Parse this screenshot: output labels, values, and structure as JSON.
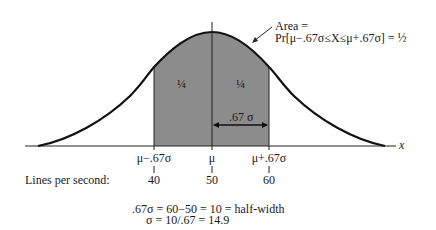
{
  "diagram": {
    "type": "normal-distribution",
    "annotation": {
      "line1": "Area =",
      "line2": "Pr[μ−.67σ≤X≤μ+.67σ] = ½"
    },
    "regions": [
      {
        "label": "¼",
        "position": "left-of-mean"
      },
      {
        "label": "¼",
        "position": "right-of-mean"
      }
    ],
    "half_width_label": ".67 σ",
    "axis_label": "x",
    "ticks": [
      {
        "symbol": "μ−.67σ",
        "value": "40"
      },
      {
        "symbol": "μ",
        "value": "50"
      },
      {
        "symbol": "μ+.67σ",
        "value": "60"
      }
    ],
    "row_label": "Lines per second:",
    "equations": [
      ".67σ = 60−50 = 10 = half-width",
      "σ = 10/.67 = 14.9"
    ],
    "colors": {
      "shade": "#8c8c8c",
      "curve": "#111111",
      "text": "#1a1a1a"
    }
  }
}
